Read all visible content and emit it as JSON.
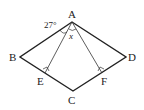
{
  "figure": {
    "type": "geometry-rhombus",
    "points": {
      "A": {
        "label": "A",
        "x": 72,
        "y": 22
      },
      "B": {
        "label": "B",
        "x": 20,
        "y": 57
      },
      "C": {
        "label": "C",
        "x": 73,
        "y": 91
      },
      "D": {
        "label": "D",
        "x": 126,
        "y": 57
      },
      "E": {
        "label": "E",
        "x": 45,
        "y": 73
      },
      "F": {
        "label": "F",
        "x": 102,
        "y": 73
      }
    },
    "angle_label": "27°",
    "unknown_label": "x",
    "colors": {
      "stroke": "#222222",
      "background": "#ffffff"
    }
  }
}
